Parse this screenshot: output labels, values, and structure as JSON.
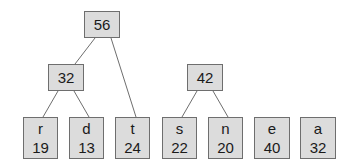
{
  "diagram": {
    "type": "tree",
    "colors": {
      "node_fill": "#dcdcdc",
      "node_border": "#6e6e6e",
      "edge": "#6e6e6e",
      "text": "#1a1a1a"
    },
    "internal_nodes": [
      {
        "id": "n56",
        "label": "56",
        "x": 84,
        "y": 11,
        "w": 36,
        "h": 27
      },
      {
        "id": "n32",
        "label": "32",
        "x": 48,
        "y": 64,
        "w": 36,
        "h": 27
      },
      {
        "id": "n42",
        "label": "42",
        "x": 187,
        "y": 64,
        "w": 36,
        "h": 27
      }
    ],
    "leaves": [
      {
        "id": "r",
        "symbol": "r",
        "weight": "19",
        "x": 23,
        "y": 117,
        "w": 35,
        "h": 42
      },
      {
        "id": "d",
        "symbol": "d",
        "weight": "13",
        "x": 69,
        "y": 117,
        "w": 35,
        "h": 42
      },
      {
        "id": "t",
        "symbol": "t",
        "weight": "24",
        "x": 115,
        "y": 117,
        "w": 35,
        "h": 42
      },
      {
        "id": "s",
        "symbol": "s",
        "weight": "22",
        "x": 162,
        "y": 117,
        "w": 35,
        "h": 42
      },
      {
        "id": "n",
        "symbol": "n",
        "weight": "20",
        "x": 208,
        "y": 117,
        "w": 35,
        "h": 42
      },
      {
        "id": "e",
        "symbol": "e",
        "weight": "40",
        "x": 254,
        "y": 117,
        "w": 36,
        "h": 42
      },
      {
        "id": "a",
        "symbol": "a",
        "weight": "32",
        "x": 300,
        "y": 117,
        "w": 36,
        "h": 42
      }
    ],
    "edges": [
      {
        "from": "n56",
        "to": "n32",
        "x1": 95,
        "y1": 38,
        "x2": 75,
        "y2": 64
      },
      {
        "from": "n56",
        "to": "t",
        "x1": 111,
        "y1": 38,
        "x2": 136,
        "y2": 117
      },
      {
        "from": "n32",
        "to": "r",
        "x1": 58,
        "y1": 91,
        "x2": 43,
        "y2": 117
      },
      {
        "from": "n32",
        "to": "d",
        "x1": 74,
        "y1": 91,
        "x2": 89,
        "y2": 117
      },
      {
        "from": "n42",
        "to": "s",
        "x1": 197,
        "y1": 91,
        "x2": 182,
        "y2": 117
      },
      {
        "from": "n42",
        "to": "n",
        "x1": 213,
        "y1": 91,
        "x2": 228,
        "y2": 117
      }
    ]
  }
}
